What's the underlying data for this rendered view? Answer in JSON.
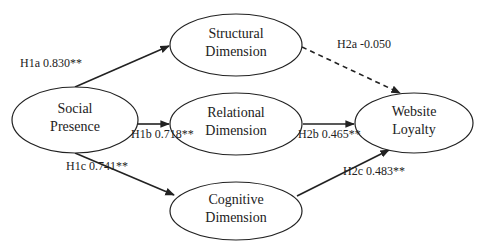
{
  "diagram": {
    "type": "structural-path-model",
    "nodes": [
      {
        "id": "social",
        "lines": [
          "Social",
          "Presence"
        ],
        "cx": 75,
        "cy": 120,
        "rx": 63,
        "ry": 33
      },
      {
        "id": "structural",
        "lines": [
          "Structural",
          "Dimension"
        ],
        "cx": 236,
        "cy": 45,
        "rx": 66,
        "ry": 31
      },
      {
        "id": "relational",
        "lines": [
          "Relational",
          "Dimension"
        ],
        "cx": 236,
        "cy": 124,
        "rx": 66,
        "ry": 31
      },
      {
        "id": "cognitive",
        "lines": [
          "Cognitive",
          "Dimension"
        ],
        "cx": 236,
        "cy": 211,
        "rx": 66,
        "ry": 29
      },
      {
        "id": "loyalty",
        "lines": [
          "Website",
          "Loyalty"
        ],
        "cx": 414,
        "cy": 123,
        "rx": 59,
        "ry": 30
      }
    ],
    "edges": [
      {
        "id": "h1a",
        "from": "social",
        "to": "structural",
        "label": "H1a 0.830**",
        "style": "solid",
        "x1": 75,
        "y1": 87,
        "x2": 169,
        "y2": 46,
        "lx": 20,
        "ly": 67
      },
      {
        "id": "h1b",
        "from": "social",
        "to": "relational",
        "label": "H1b 0.718**",
        "style": "solid",
        "x1": 138,
        "y1": 124,
        "x2": 169,
        "y2": 124,
        "lx": 131,
        "ly": 138
      },
      {
        "id": "h1c",
        "from": "social",
        "to": "cognitive",
        "label": "H1c 0.741**",
        "style": "solid",
        "x1": 75,
        "y1": 153,
        "x2": 174,
        "y2": 195,
        "lx": 66,
        "ly": 170
      },
      {
        "id": "h2a",
        "from": "structural",
        "to": "loyalty",
        "label": "H2a -0.050",
        "style": "dashed",
        "x1": 302,
        "y1": 47,
        "x2": 400,
        "y2": 93,
        "lx": 337,
        "ly": 48
      },
      {
        "id": "h2b",
        "from": "relational",
        "to": "loyalty",
        "label": "H2b 0.465**",
        "style": "solid",
        "x1": 303,
        "y1": 124,
        "x2": 354,
        "y2": 124,
        "lx": 298,
        "ly": 138
      },
      {
        "id": "h2c",
        "from": "cognitive",
        "to": "loyalty",
        "label": "H2c 0.483**",
        "style": "solid",
        "x1": 297,
        "y1": 196,
        "x2": 389,
        "y2": 150,
        "lx": 343,
        "ly": 175
      }
    ]
  },
  "colors": {
    "stroke": "#222222",
    "background": "#ffffff"
  }
}
